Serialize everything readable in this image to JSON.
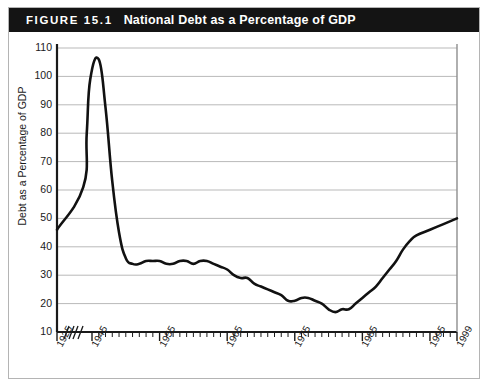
{
  "figure": {
    "number_label": "FIGURE 15.1",
    "title": "National Debt as a Percentage of GDP"
  },
  "colors": {
    "title_bar_background": "#141414",
    "title_text": "#ffffff",
    "frame_border": "#b4b4b4",
    "axis": "#1a1a1a",
    "gridline": "#b9b9b9",
    "data_line": "#111111",
    "plot_background": "#ffffff"
  },
  "chart_data": {
    "type": "line",
    "title": "National Debt as a Percentage of GDP",
    "xlabel": "",
    "ylabel": "Debt as a Percentage of GDP",
    "ylim": [
      10,
      110
    ],
    "ytick_step": 10,
    "yticks": [
      10,
      20,
      30,
      40,
      50,
      60,
      70,
      80,
      90,
      100,
      110
    ],
    "xticks": [
      1925,
      1945,
      1955,
      1965,
      1975,
      1985,
      1995,
      1999
    ],
    "xtick_labels": [
      "1925",
      "1945",
      "1955",
      "1965",
      "1975",
      "1985",
      "1995",
      "1999"
    ],
    "grid": true,
    "grid_axis": "y",
    "legend": null,
    "axis_breaks": 2,
    "axis_break_note": "Two break marks between 1925 and 1945 indicating compressed/omitted years",
    "series": [
      {
        "name": "Debt as a Percentage of GDP",
        "x": [
          1925,
          1940,
          1942,
          1944,
          1946,
          1947,
          1948,
          1949,
          1950,
          1951,
          1952,
          1953,
          1954,
          1955,
          1956,
          1957,
          1958,
          1959,
          1960,
          1961,
          1962,
          1963,
          1964,
          1965,
          1966,
          1967,
          1968,
          1969,
          1970,
          1971,
          1972,
          1973,
          1974,
          1975,
          1976,
          1977,
          1978,
          1979,
          1980,
          1981,
          1982,
          1983,
          1984,
          1985,
          1986,
          1987,
          1988,
          1989,
          1990,
          1991,
          1992,
          1993,
          1995,
          1997,
          1999
        ],
        "y": [
          46,
          61,
          80,
          99,
          106,
          89,
          63,
          45,
          36,
          34,
          34,
          35,
          35,
          35,
          34,
          34,
          35,
          35,
          34,
          35,
          35,
          34,
          33,
          32,
          30,
          29,
          29,
          27,
          26,
          25,
          24,
          23,
          21,
          21,
          22,
          22,
          21,
          20,
          18,
          17,
          18,
          18,
          20,
          22,
          24,
          26,
          29,
          32,
          35,
          39,
          42,
          44,
          46,
          48,
          50
        ]
      }
    ],
    "annotations": {
      "start_value": 46,
      "wwii_peak_value": 106,
      "wwii_peak_year": 1946,
      "postwar_plateau_value": 35,
      "minimum_value": 17,
      "minimum_year": 1974,
      "modern_peak_value": 82,
      "modern_peak_year": 1993,
      "end_value": 63,
      "end_year": 1999
    }
  }
}
